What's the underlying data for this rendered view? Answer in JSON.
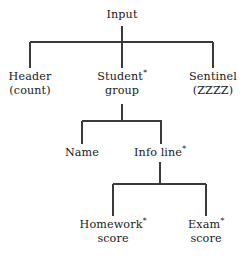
{
  "diagram": {
    "title": "Input",
    "type": "structure-chart",
    "background_color": "#ffffff",
    "line_color": "#3a3a3a",
    "text_color": "#1a1a1a",
    "nodes": [
      {
        "id": "input",
        "line1": "Input",
        "line2": "",
        "marker": "",
        "x": 122,
        "level": 0
      },
      {
        "id": "header",
        "line1": "Header",
        "line2": "(count)",
        "marker": "",
        "x": 30,
        "level": 1
      },
      {
        "id": "student-group",
        "line1": "Student",
        "line2": "group",
        "marker": "*",
        "x": 122,
        "level": 1
      },
      {
        "id": "sentinel",
        "line1": "Sentinel",
        "line2": "(ZZZZ)",
        "marker": "",
        "x": 213,
        "level": 1
      },
      {
        "id": "name",
        "line1": "Name",
        "line2": "",
        "marker": "",
        "x": 82,
        "level": 2
      },
      {
        "id": "info-line",
        "line1": "Info line",
        "line2": "",
        "marker": "*",
        "x": 160,
        "level": 2
      },
      {
        "id": "homework-score",
        "line1": "Homework",
        "line2": "score",
        "marker": "*",
        "x": 113,
        "level": 3
      },
      {
        "id": "exam-score",
        "line1": "Exam",
        "line2": "score",
        "marker": "*",
        "x": 206,
        "level": 3
      }
    ],
    "edges": [
      {
        "parent": "input",
        "children": [
          "header",
          "student-group",
          "sentinel"
        ]
      },
      {
        "parent": "student-group",
        "children": [
          "name",
          "info-line"
        ]
      },
      {
        "parent": "info-line",
        "children": [
          "homework-score",
          "exam-score"
        ]
      }
    ]
  }
}
